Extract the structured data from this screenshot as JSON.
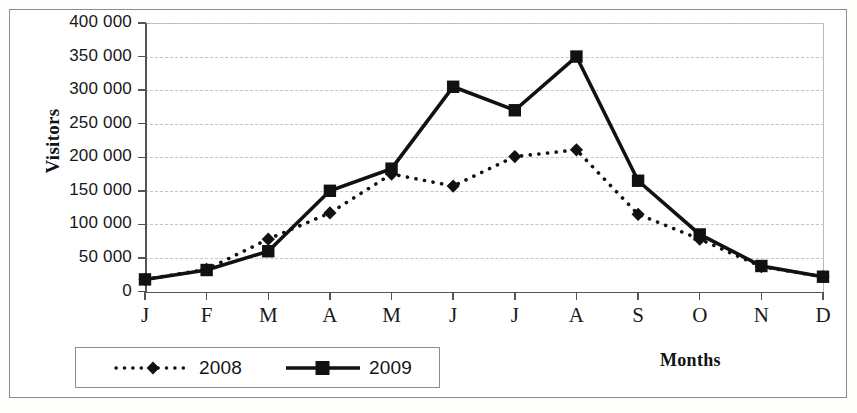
{
  "chart_data": {
    "type": "line",
    "title": "",
    "xlabel": "Months",
    "ylabel": "Visitors",
    "categories": [
      "J",
      "F",
      "M",
      "A",
      "M",
      "J",
      "J",
      "A",
      "S",
      "O",
      "N",
      "D"
    ],
    "category_names": [
      "January",
      "February",
      "March",
      "April",
      "May",
      "June",
      "July",
      "August",
      "September",
      "October",
      "November",
      "December"
    ],
    "ylim": [
      0,
      400000
    ],
    "yticks": [
      0,
      50000,
      100000,
      150000,
      200000,
      250000,
      300000,
      350000,
      400000
    ],
    "ytick_labels": [
      "0",
      "50 000",
      "100 000",
      "150 000",
      "200 000",
      "250 000",
      "300 000",
      "350 000",
      "400 000"
    ],
    "grid": true,
    "grid_axis": "y",
    "legend_position": "bottom-left",
    "series": [
      {
        "name": "2008",
        "color": "#111111",
        "line_style": "dotted",
        "marker": "diamond",
        "values": [
          18000,
          33000,
          78000,
          117000,
          175000,
          157000,
          201000,
          211000,
          115000,
          78000,
          37000,
          22000
        ]
      },
      {
        "name": "2009",
        "color": "#111111",
        "line_style": "solid",
        "marker": "square",
        "values": [
          18000,
          32000,
          60000,
          150000,
          183000,
          305000,
          270000,
          350000,
          165000,
          85000,
          38000,
          22000
        ]
      }
    ]
  },
  "legend": {
    "entries": [
      {
        "label": "2008"
      },
      {
        "label": "2009"
      }
    ]
  },
  "axes": {
    "y_title": "Visitors",
    "x_title": "Months"
  }
}
